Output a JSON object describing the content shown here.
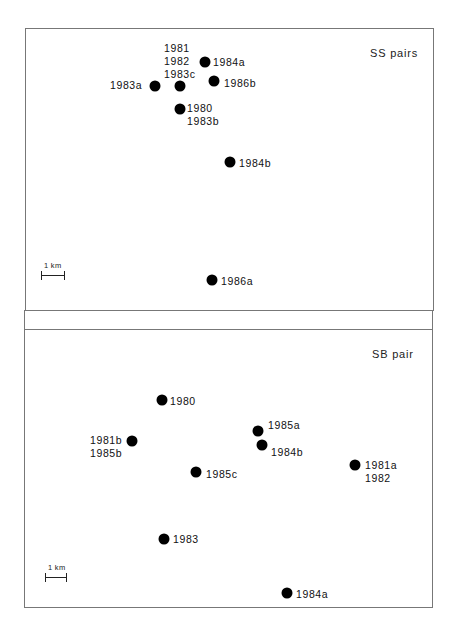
{
  "panels": [
    {
      "id": "ss",
      "title": "SS pairs",
      "scale_label": "1 km",
      "points": [
        {
          "label_lines": [
            "1981",
            "1982",
            "1983c"
          ],
          "dot": [
            180,
            86
          ],
          "label_pos": [
            164,
            42
          ]
        },
        {
          "label_lines": [
            "1984a"
          ],
          "dot": [
            205,
            62
          ],
          "label_pos": [
            213,
            56
          ]
        },
        {
          "label_lines": [
            "1983a"
          ],
          "dot": [
            155,
            86
          ],
          "label_pos": [
            110,
            79
          ]
        },
        {
          "label_lines": [
            "1986b"
          ],
          "dot": [
            214,
            81
          ],
          "label_pos": [
            224,
            77
          ]
        },
        {
          "label_lines": [
            "1980",
            "1983b"
          ],
          "dot": [
            180,
            109
          ],
          "label_pos": [
            187,
            102
          ]
        },
        {
          "label_lines": [
            "1984b"
          ],
          "dot": [
            230,
            162
          ],
          "label_pos": [
            239,
            157
          ]
        },
        {
          "label_lines": [
            "1986a"
          ],
          "dot": [
            212,
            280
          ],
          "label_pos": [
            221,
            275
          ]
        }
      ]
    },
    {
      "id": "sb",
      "title": "SB pair",
      "scale_label": "1 km",
      "points": [
        {
          "label_lines": [
            "1980"
          ],
          "dot": [
            162,
            400
          ],
          "label_pos": [
            170,
            395
          ]
        },
        {
          "label_lines": [
            "1981b",
            "1985b"
          ],
          "dot": [
            132,
            441
          ],
          "label_pos": [
            90,
            434
          ]
        },
        {
          "label_lines": [
            "1985a"
          ],
          "dot": [
            258,
            431
          ],
          "label_pos": [
            268,
            419
          ]
        },
        {
          "label_lines": [
            "1984b"
          ],
          "dot": [
            262,
            445
          ],
          "label_pos": [
            271,
            446
          ]
        },
        {
          "label_lines": [
            "1985c"
          ],
          "dot": [
            196,
            472
          ],
          "label_pos": [
            206,
            468
          ]
        },
        {
          "label_lines": [
            "1981a",
            "1982"
          ],
          "dot": [
            355,
            465
          ],
          "label_pos": [
            365,
            459
          ]
        },
        {
          "label_lines": [
            "1983"
          ],
          "dot": [
            164,
            539
          ],
          "label_pos": [
            173,
            533
          ]
        },
        {
          "label_lines": [
            "1984a"
          ],
          "dot": [
            287,
            593
          ],
          "label_pos": [
            296,
            588
          ]
        }
      ]
    }
  ]
}
